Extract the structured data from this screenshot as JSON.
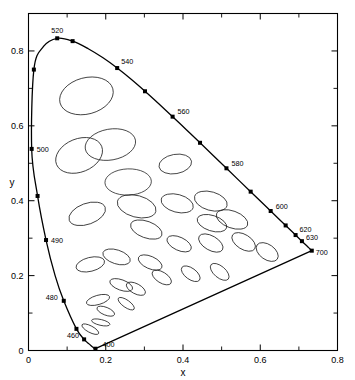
{
  "chart_data": {
    "type": "scatter",
    "xlabel": "x",
    "ylabel": "y",
    "xlim": [
      0,
      0.8
    ],
    "ylim": [
      0,
      0.9
    ],
    "xticks": [
      0,
      0.2,
      0.4,
      0.6,
      0.8
    ],
    "xticklabels": [
      "0",
      "0.2",
      "0.4",
      "0.6",
      "0.8"
    ],
    "yticks": [
      0,
      0.2,
      0.4,
      0.6,
      0.8
    ],
    "yticklabels": [
      "0",
      "0.2",
      "0.4",
      "0.6",
      "0.8"
    ],
    "minor_tick_step": 0.1,
    "grid": false,
    "legend": "none",
    "frame": "box",
    "spectral_locus": {
      "name": "spectral-locus",
      "closed": true,
      "points": [
        [
          0.1733,
          0.0048
        ],
        [
          0.1732,
          0.0048
        ],
        [
          0.1726,
          0.0049
        ],
        [
          0.1714,
          0.0051
        ],
        [
          0.1689,
          0.0069
        ],
        [
          0.1644,
          0.0109
        ],
        [
          0.1566,
          0.0177
        ],
        [
          0.144,
          0.0297
        ],
        [
          0.1241,
          0.0578
        ],
        [
          0.0913,
          0.1327
        ],
        [
          0.0687,
          0.2007
        ],
        [
          0.0454,
          0.295
        ],
        [
          0.0235,
          0.4127
        ],
        [
          0.0082,
          0.5384
        ],
        [
          0.0139,
          0.7502
        ],
        [
          0.0389,
          0.812
        ],
        [
          0.0743,
          0.8338
        ],
        [
          0.1142,
          0.8262
        ],
        [
          0.1547,
          0.8059
        ],
        [
          0.1929,
          0.7816
        ],
        [
          0.2296,
          0.7543
        ],
        [
          0.2658,
          0.7243
        ],
        [
          0.3016,
          0.6923
        ],
        [
          0.3373,
          0.6589
        ],
        [
          0.3731,
          0.6245
        ],
        [
          0.4087,
          0.5896
        ],
        [
          0.4441,
          0.5547
        ],
        [
          0.4788,
          0.5202
        ],
        [
          0.5125,
          0.4866
        ],
        [
          0.5448,
          0.4544
        ],
        [
          0.5752,
          0.4242
        ],
        [
          0.6029,
          0.3965
        ],
        [
          0.627,
          0.3725
        ],
        [
          0.6482,
          0.3514
        ],
        [
          0.6658,
          0.334
        ],
        [
          0.6801,
          0.3197
        ],
        [
          0.6915,
          0.3083
        ],
        [
          0.7006,
          0.2993
        ],
        [
          0.7079,
          0.292
        ],
        [
          0.714,
          0.2859
        ],
        [
          0.719,
          0.2809
        ],
        [
          0.723,
          0.277
        ],
        [
          0.726,
          0.274
        ],
        [
          0.7334,
          0.2666
        ]
      ]
    },
    "wavelength_markers": [
      {
        "label": "400",
        "x": 0.1733,
        "y": 0.0048,
        "label_dx": 7,
        "label_dy": -2
      },
      {
        "label": "",
        "x": 0.1241,
        "y": 0.0578,
        "label_dx": 0,
        "label_dy": 0
      },
      {
        "label": "460",
        "x": 0.144,
        "y": 0.0297,
        "label_dx": -17,
        "label_dy": -1
      },
      {
        "label": "480",
        "x": 0.0913,
        "y": 0.1327,
        "label_dx": -18,
        "label_dy": -1
      },
      {
        "label": "490",
        "x": 0.0454,
        "y": 0.295,
        "label_dx": 5,
        "label_dy": 3
      },
      {
        "label": "",
        "x": 0.0235,
        "y": 0.4127,
        "label_dx": 0,
        "label_dy": 0
      },
      {
        "label": "500",
        "x": 0.0082,
        "y": 0.5384,
        "label_dx": 5,
        "label_dy": 3
      },
      {
        "label": "",
        "x": 0.0139,
        "y": 0.7502,
        "label_dx": 0,
        "label_dy": 0
      },
      {
        "label": "520",
        "x": 0.0743,
        "y": 0.8338,
        "label_dx": -6,
        "label_dy": -5
      },
      {
        "label": "",
        "x": 0.1142,
        "y": 0.8262,
        "label_dx": 0,
        "label_dy": 0
      },
      {
        "label": "540",
        "x": 0.2296,
        "y": 0.7543,
        "label_dx": 4,
        "label_dy": -4
      },
      {
        "label": "",
        "x": 0.3016,
        "y": 0.6923,
        "label_dx": 0,
        "label_dy": 0
      },
      {
        "label": "560",
        "x": 0.3731,
        "y": 0.6245,
        "label_dx": 5,
        "label_dy": -3
      },
      {
        "label": "",
        "x": 0.4441,
        "y": 0.5547,
        "label_dx": 0,
        "label_dy": 0
      },
      {
        "label": "580",
        "x": 0.5125,
        "y": 0.4866,
        "label_dx": 5,
        "label_dy": -2
      },
      {
        "label": "",
        "x": 0.5752,
        "y": 0.4242,
        "label_dx": 0,
        "label_dy": 0
      },
      {
        "label": "600",
        "x": 0.627,
        "y": 0.3725,
        "label_dx": 5,
        "label_dy": -2
      },
      {
        "label": "",
        "x": 0.6658,
        "y": 0.334,
        "label_dx": 0,
        "label_dy": 0
      },
      {
        "label": "620",
        "x": 0.6915,
        "y": 0.3083,
        "label_dx": 4,
        "label_dy": -3
      },
      {
        "label": "630",
        "x": 0.7079,
        "y": 0.292,
        "label_dx": 4,
        "label_dy": -1
      },
      {
        "label": "700",
        "x": 0.7334,
        "y": 0.2666,
        "label_dx": 4,
        "label_dy": 4
      }
    ],
    "ellipses_note": "MacAdam just-noticeable-difference ellipses, axes enlarged 10x",
    "ellipses": [
      {
        "cx": 0.16,
        "cy": 0.057,
        "rx": 0.0085,
        "ry": 0.025,
        "angle": 62
      },
      {
        "cx": 0.187,
        "cy": 0.075,
        "rx": 0.0075,
        "ry": 0.025,
        "angle": 77
      },
      {
        "cx": 0.253,
        "cy": 0.125,
        "rx": 0.0095,
        "ry": 0.0255,
        "angle": 55
      },
      {
        "cx": 0.15,
        "cy": 0.68,
        "rx": 0.047,
        "ry": 0.073,
        "angle": 105
      },
      {
        "cx": 0.131,
        "cy": 0.521,
        "rx": 0.043,
        "ry": 0.065,
        "angle": 112
      },
      {
        "cx": 0.212,
        "cy": 0.55,
        "rx": 0.04,
        "ry": 0.068,
        "angle": 100
      },
      {
        "cx": 0.258,
        "cy": 0.45,
        "rx": 0.034,
        "ry": 0.062,
        "angle": 92
      },
      {
        "cx": 0.152,
        "cy": 0.365,
        "rx": 0.027,
        "ry": 0.051,
        "angle": 110
      },
      {
        "cx": 0.28,
        "cy": 0.385,
        "rx": 0.028,
        "ry": 0.053,
        "angle": 75
      },
      {
        "cx": 0.38,
        "cy": 0.498,
        "rx": 0.025,
        "ry": 0.044,
        "angle": 100
      },
      {
        "cx": 0.16,
        "cy": 0.23,
        "rx": 0.018,
        "ry": 0.039,
        "angle": 104
      },
      {
        "cx": 0.228,
        "cy": 0.25,
        "rx": 0.018,
        "ry": 0.038,
        "angle": 72
      },
      {
        "cx": 0.305,
        "cy": 0.323,
        "rx": 0.0215,
        "ry": 0.044,
        "angle": 70
      },
      {
        "cx": 0.385,
        "cy": 0.393,
        "rx": 0.023,
        "ry": 0.044,
        "angle": 75
      },
      {
        "cx": 0.472,
        "cy": 0.399,
        "rx": 0.024,
        "ry": 0.045,
        "angle": 74
      },
      {
        "cx": 0.527,
        "cy": 0.35,
        "rx": 0.022,
        "ry": 0.044,
        "angle": 70
      },
      {
        "cx": 0.475,
        "cy": 0.34,
        "rx": 0.02,
        "ry": 0.041,
        "angle": 72
      },
      {
        "cx": 0.18,
        "cy": 0.135,
        "rx": 0.012,
        "ry": 0.032,
        "angle": 106
      },
      {
        "cx": 0.24,
        "cy": 0.175,
        "rx": 0.0135,
        "ry": 0.032,
        "angle": 70
      },
      {
        "cx": 0.315,
        "cy": 0.235,
        "rx": 0.016,
        "ry": 0.034,
        "angle": 66
      },
      {
        "cx": 0.39,
        "cy": 0.285,
        "rx": 0.017,
        "ry": 0.035,
        "angle": 65
      },
      {
        "cx": 0.472,
        "cy": 0.287,
        "rx": 0.0185,
        "ry": 0.036,
        "angle": 60
      },
      {
        "cx": 0.557,
        "cy": 0.29,
        "rx": 0.019,
        "ry": 0.035,
        "angle": 58
      },
      {
        "cx": 0.618,
        "cy": 0.263,
        "rx": 0.0195,
        "ry": 0.033,
        "angle": 55
      },
      {
        "cx": 0.278,
        "cy": 0.165,
        "rx": 0.013,
        "ry": 0.028,
        "angle": 62
      },
      {
        "cx": 0.345,
        "cy": 0.195,
        "rx": 0.014,
        "ry": 0.029,
        "angle": 58
      },
      {
        "cx": 0.42,
        "cy": 0.205,
        "rx": 0.0145,
        "ry": 0.029,
        "angle": 54
      },
      {
        "cx": 0.495,
        "cy": 0.21,
        "rx": 0.015,
        "ry": 0.03,
        "angle": 50
      },
      {
        "cx": 0.2,
        "cy": 0.105,
        "rx": 0.01,
        "ry": 0.025,
        "angle": 68
      }
    ]
  },
  "caption": {
    "text": "",
    "visible": false
  }
}
